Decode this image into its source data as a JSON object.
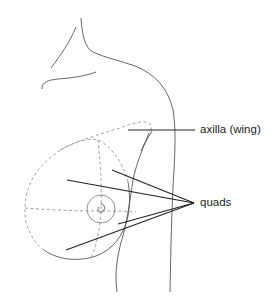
{
  "diagram": {
    "colors": {
      "background": "#ffffff",
      "outline": "#555555",
      "dashed_guides": "#888888",
      "leader_lines": "#222222",
      "label_text": "#222222",
      "stipple": "#d8d8d8"
    },
    "labels": {
      "axilla": "axilla (wing)",
      "quads": "quads"
    },
    "leaders": {
      "axilla": {
        "from": [
          128,
          130
        ],
        "to": [
          195,
          130
        ]
      },
      "quads": {
        "apex": [
          194,
          203
        ],
        "endpoints": [
          [
            67,
            180
          ],
          [
            112,
            170
          ],
          [
            118,
            224
          ],
          [
            66,
            250
          ]
        ]
      }
    }
  }
}
